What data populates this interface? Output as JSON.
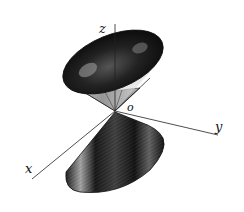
{
  "diagram": {
    "type": "double-cone",
    "labels": {
      "z_axis": "z",
      "y_axis": "y",
      "x_axis": "x",
      "origin": "o"
    },
    "colors": {
      "ink": "#111111",
      "paper": "#ffffff",
      "highlight": "#cfcfcf"
    }
  }
}
